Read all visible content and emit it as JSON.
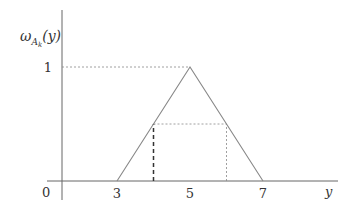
{
  "chart_data": {
    "type": "line",
    "title": "",
    "ylabel": "ω_{A_k}(y)",
    "ylabel_parts": {
      "base": "ω",
      "sub": "A",
      "subsub": "k",
      "arg": "(y)"
    },
    "xlabel": "y",
    "origin_label": "0",
    "x_ticks": [
      3,
      5,
      7
    ],
    "y_ticks": [
      1
    ],
    "xlim": [
      0,
      8.6
    ],
    "ylim": [
      0,
      1.2
    ],
    "series": [
      {
        "name": "triangular-membership",
        "points": [
          [
            3,
            0
          ],
          [
            5,
            1
          ],
          [
            7,
            0
          ]
        ],
        "style": "solid"
      }
    ],
    "guides": [
      {
        "name": "peak-horizontal-guide",
        "from": [
          0,
          1
        ],
        "to": [
          5,
          1
        ],
        "style": "dotted"
      },
      {
        "name": "alpha-cut-horizontal-guide",
        "from": [
          4,
          0.5
        ],
        "to": [
          6,
          0.5
        ],
        "style": "dotted"
      },
      {
        "name": "left-cut-vertical-guide",
        "from": [
          4,
          0
        ],
        "to": [
          4,
          0.5
        ],
        "style": "dashed"
      },
      {
        "name": "right-cut-vertical-guide",
        "from": [
          6,
          0
        ],
        "to": [
          6,
          0.5
        ],
        "style": "dotted"
      }
    ]
  }
}
